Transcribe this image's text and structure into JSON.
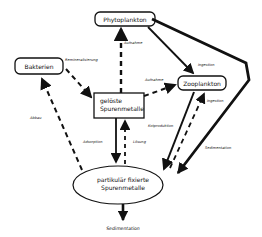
{
  "diagram": {
    "nodes": {
      "phytoplankton": "Phytoplankton",
      "bakterien": "Bakterien",
      "zooplankton": "Zooplankton",
      "geloeste_line1": "gelöste",
      "geloeste_line2": "Spurenmetalle",
      "partikulaer_line1": "partikulär fixierte",
      "partikulaer_line2": "Spurenmetalle",
      "sedimentation_bottom": "Sedimentation"
    },
    "edges": {
      "remineralisierung": "Remineralisierung",
      "aufnahme_phyto": "Aufnahme",
      "aufnahme_zoo": "Aufnahme",
      "ingestion_phyto_zoo": "Ingestion",
      "ingestion_part_zoo": "Ingestion",
      "kotproduktion": "Kotproduktion",
      "sedimentation_phyto": "Sedimentation",
      "abbau": "Abbau",
      "adsorption": "Adsorption",
      "loesung": "Lösung"
    }
  }
}
